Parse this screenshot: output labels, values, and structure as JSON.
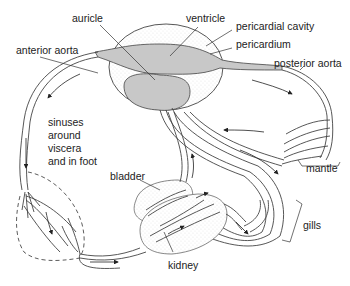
{
  "diagram": {
    "type": "circulatory system schematic (mollusc)",
    "labels": {
      "auricle": "auricle",
      "ventricle": "ventricle",
      "pericardial_cavity": "pericardial cavity",
      "pericardium": "pericardium",
      "anterior_aorta": "anterior aorta",
      "posterior_aorta": "posterior aorta",
      "sinuses_line1": "sinuses",
      "sinuses_line2": "around",
      "sinuses_line3": "viscera",
      "sinuses_line4": "and in foot",
      "mantle": "mantle",
      "bladder": "bladder",
      "gills": "gills",
      "kidney": "kidney"
    },
    "colors": {
      "heart_fill": "#c8c8c8",
      "vessel_fill": "#cfcfcf",
      "stroke": "#444444",
      "stipple": "#e6e6e6"
    }
  }
}
